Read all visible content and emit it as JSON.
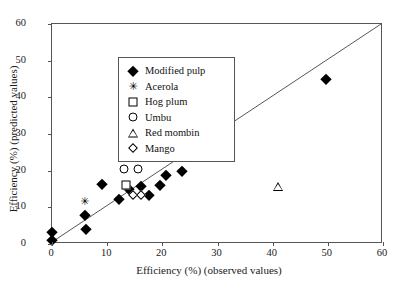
{
  "chart_data": {
    "type": "scatter",
    "title": "",
    "xlabel": "Efficiency (%) (observed values)",
    "ylabel": "Efficiency (%) (predicted values)",
    "xlim": [
      0,
      60
    ],
    "ylim": [
      0,
      60
    ],
    "xticks": [
      0,
      10,
      20,
      30,
      40,
      50,
      60
    ],
    "yticks": [
      0,
      10,
      20,
      30,
      40,
      50,
      60
    ],
    "xticklabels": [
      "0",
      "10",
      "20",
      "30",
      "40",
      "50",
      "60"
    ],
    "yticklabels": [
      "0",
      "10",
      "20",
      "30",
      "40",
      "50",
      "60"
    ],
    "grid": false,
    "legend_position": "upper left",
    "reference_line": {
      "name": "1:1 identity line",
      "from": [
        0,
        0
      ],
      "to": [
        60,
        60
      ]
    },
    "series": [
      {
        "name": "Modified pulp",
        "marker": "filled-diamond",
        "color": "#000000",
        "points": [
          [
            0.0,
            3.2
          ],
          [
            0.0,
            1.0
          ],
          [
            5.9,
            8.0
          ],
          [
            6.2,
            4.2
          ],
          [
            9.0,
            16.3
          ],
          [
            12.2,
            12.3
          ],
          [
            13.9,
            15.0
          ],
          [
            16.2,
            15.9
          ],
          [
            17.6,
            13.3
          ],
          [
            19.6,
            16.0
          ],
          [
            20.7,
            18.8
          ],
          [
            21.8,
            25.5
          ],
          [
            23.5,
            20.0
          ],
          [
            26.4,
            31.3
          ],
          [
            27.6,
            31.5
          ],
          [
            27.2,
            27.0
          ],
          [
            49.6,
            45.0
          ]
        ]
      },
      {
        "name": "Acerola",
        "marker": "x-star",
        "color": "#000000",
        "points": [
          [
            5.9,
            11.7
          ]
        ]
      },
      {
        "name": "Hog plum",
        "marker": "open-square",
        "color": "#000000",
        "points": [
          [
            13.5,
            16.1
          ]
        ]
      },
      {
        "name": "Umbu",
        "marker": "open-circle",
        "color": "#000000",
        "points": [
          [
            13.0,
            20.5
          ],
          [
            15.5,
            20.5
          ]
        ]
      },
      {
        "name": "Red mombin",
        "marker": "open-triangle",
        "color": "#000000",
        "points": [
          [
            40.9,
            15.5
          ]
        ]
      },
      {
        "name": "Mango",
        "marker": "open-diamond",
        "color": "#000000",
        "points": [
          [
            14.6,
            13.4
          ],
          [
            16.2,
            13.4
          ]
        ]
      }
    ]
  },
  "legend": {
    "items": [
      {
        "label": "Modified pulp",
        "marker": "filled-diamond"
      },
      {
        "label": "Acerola",
        "marker": "x-star"
      },
      {
        "label": "Hog plum",
        "marker": "open-square"
      },
      {
        "label": "Umbu",
        "marker": "open-circle"
      },
      {
        "label": "Red mombin",
        "marker": "open-triangle"
      },
      {
        "label": "Mango",
        "marker": "open-diamond"
      }
    ]
  },
  "glyphs": {
    "x_star": "✳"
  }
}
